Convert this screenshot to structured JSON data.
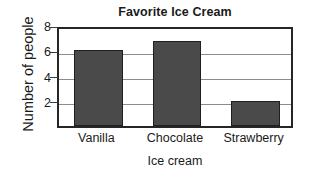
{
  "chart_data": {
    "type": "bar",
    "title": "Favorite Ice Cream",
    "xlabel": "Ice cream",
    "ylabel": "Number of people",
    "categories": [
      "Vanilla",
      "Chocolate",
      "Strawberry"
    ],
    "values": [
      6,
      6.75,
      2
    ],
    "ylim": [
      0,
      8
    ],
    "yticks": [
      2,
      4,
      6,
      8
    ],
    "ytick_labels": [
      "2",
      "4",
      "6",
      "8"
    ],
    "grid": "horizontal",
    "legend": "none",
    "bar_color": "#4a4a4a",
    "bar_edge_color": "#1f1f1f",
    "gridline_color": "#8c8c8c",
    "axis_color": "#262626",
    "background_color": "#ffffff"
  }
}
